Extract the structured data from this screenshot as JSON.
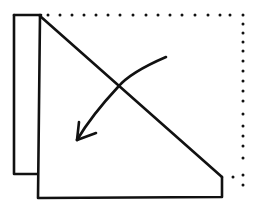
{
  "diagram": {
    "type": "folding-instruction",
    "stroke_color": "#111111",
    "background": "#ffffff",
    "elements": {
      "folded_flap": {
        "label": "folded-flap-rectangle"
      },
      "main_shape": {
        "label": "folded-paper-shape"
      },
      "diagonal_fold_line": {
        "label": "diagonal-fold-line"
      },
      "dotted_outline": {
        "label": "original-square-outline",
        "style": "dotted"
      },
      "fold_arrow": {
        "label": "fold-direction-arrow",
        "direction": "down-left"
      }
    }
  }
}
